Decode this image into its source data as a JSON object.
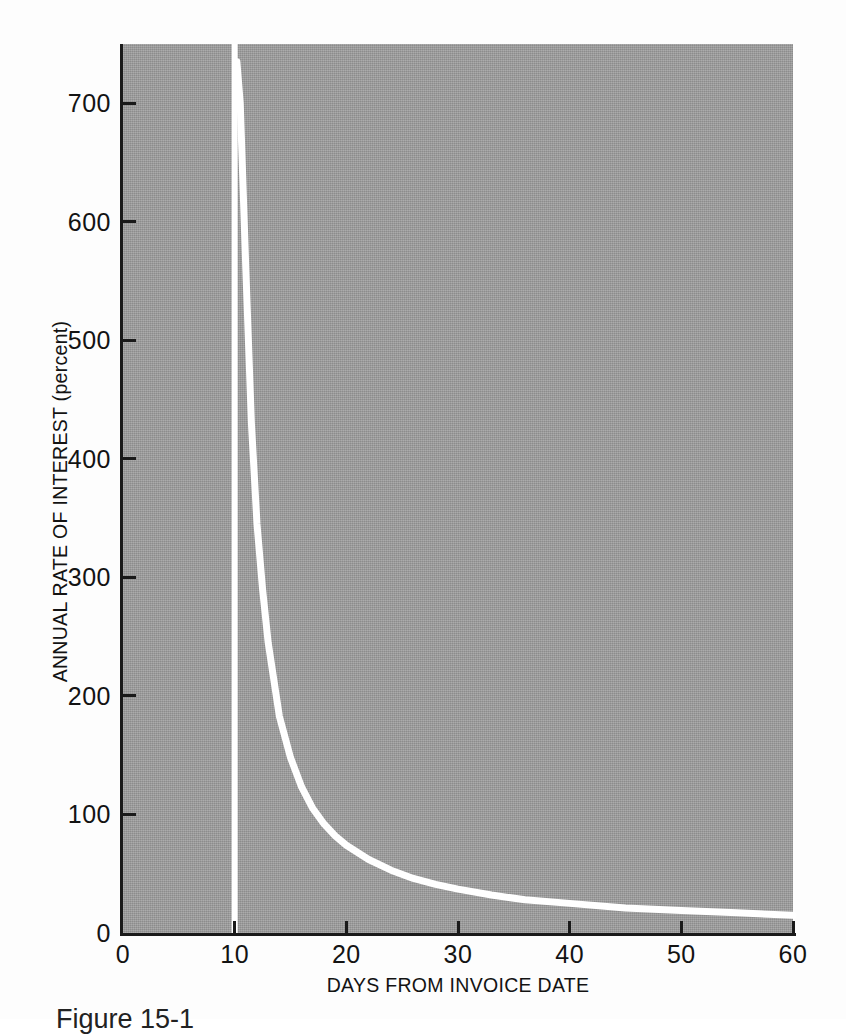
{
  "figure": {
    "caption": "Figure 15-1"
  },
  "chart_data": {
    "type": "line",
    "title": "",
    "subtitle": "",
    "xlabel": "DAYS FROM INVOICE DATE",
    "ylabel": "ANNUAL RATE OF INTEREST (percent)",
    "xlim": [
      0,
      60
    ],
    "ylim": [
      0,
      750
    ],
    "grid": false,
    "legend": null,
    "legend_position": "none",
    "xticks": [
      0,
      10,
      20,
      30,
      40,
      50,
      60
    ],
    "xtick_labels": [
      "0",
      "10",
      "20",
      "30",
      "40",
      "50",
      "60"
    ],
    "yticks": [
      0,
      100,
      200,
      300,
      400,
      500,
      600,
      700
    ],
    "ytick_labels": [
      "0",
      "100",
      "200",
      "300",
      "400",
      "500",
      "600",
      "700"
    ],
    "plot_background": "#9c9c9c",
    "line_color": "#ffffff",
    "line_width_px": 6,
    "annotations": [
      {
        "name": "vertical-asymptote",
        "text": "",
        "x": 10,
        "description": "vertical white line at day 10 spanning full plot height"
      }
    ],
    "series": [
      {
        "name": "Annual rate of interest",
        "x": [
          10.2,
          10.5,
          11,
          11.5,
          12,
          12.5,
          13,
          14,
          15,
          16,
          17,
          18,
          19,
          20,
          22,
          24,
          26,
          28,
          30,
          33,
          36,
          40,
          45,
          50,
          55,
          60
        ],
        "values": [
          735,
          700,
          560,
          430,
          345,
          290,
          245,
          183,
          148,
          123,
          105,
          92,
          82,
          74,
          62,
          53,
          46,
          41,
          37,
          32,
          28,
          25,
          21,
          19,
          17,
          15
        ]
      }
    ]
  },
  "axes": {
    "y_axis_name": "annual-rate-of-interest-axis",
    "x_axis_name": "days-from-invoice-date-axis"
  }
}
